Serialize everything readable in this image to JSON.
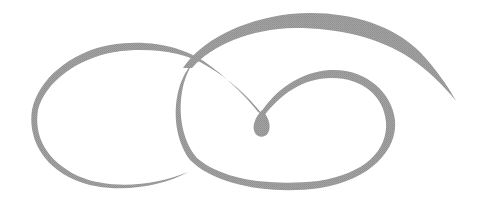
{
  "image": {
    "kind": "decorative-calligraphic-swirl",
    "background": "#ffffff",
    "stroke_color": "#9a9a9a",
    "elements": [
      "left-loop",
      "upper-arc",
      "center-droplet",
      "right-loop"
    ]
  }
}
